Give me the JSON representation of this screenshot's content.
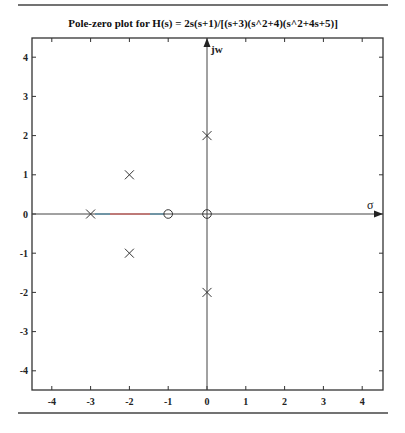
{
  "chart_data": {
    "type": "scatter",
    "title": "Pole-zero plot for  H(s) = 2s(s+1)/[(s+3)(s^2+4)(s^2+4s+5)]",
    "xlabel": "σ",
    "ylabel": "jw",
    "xlim": [
      -4.5,
      4.5
    ],
    "ylim": [
      -4.5,
      4.5
    ],
    "x_ticks": [
      -4,
      -3,
      -2,
      -1,
      0,
      1,
      2,
      3,
      4
    ],
    "y_ticks": [
      -4,
      -3,
      -2,
      -1,
      0,
      1,
      2,
      3,
      4
    ],
    "grid": false,
    "series": [
      {
        "name": "poles",
        "marker": "x",
        "points": [
          [
            -3,
            0
          ],
          [
            -2,
            1
          ],
          [
            -2,
            -1
          ],
          [
            0,
            2
          ],
          [
            0,
            -2
          ]
        ]
      },
      {
        "name": "zeros",
        "marker": "o",
        "points": [
          [
            -1,
            0
          ],
          [
            0,
            0
          ]
        ]
      }
    ],
    "annotations": [
      {
        "type": "highlight-segment",
        "from": [
          -3,
          0
        ],
        "to": [
          -1,
          0
        ],
        "color": "#d9534f"
      }
    ]
  },
  "labels": {
    "title": "Pole-zero plot for  H(s) = 2s(s+1)/[(s+3)(s^2+4)(s^2+4s+5)]",
    "jw": "jw",
    "sigma": "σ",
    "x_ticks": [
      "-4",
      "-3",
      "-2",
      "-1",
      "0",
      "1",
      "2",
      "3",
      "4"
    ],
    "y_ticks": [
      "4",
      "3",
      "2",
      "1",
      "0",
      "-1",
      "-2",
      "-3",
      "-4"
    ]
  },
  "colors": {
    "axis": "#333333",
    "marker": "#333333",
    "highlight": "#d9534f"
  }
}
